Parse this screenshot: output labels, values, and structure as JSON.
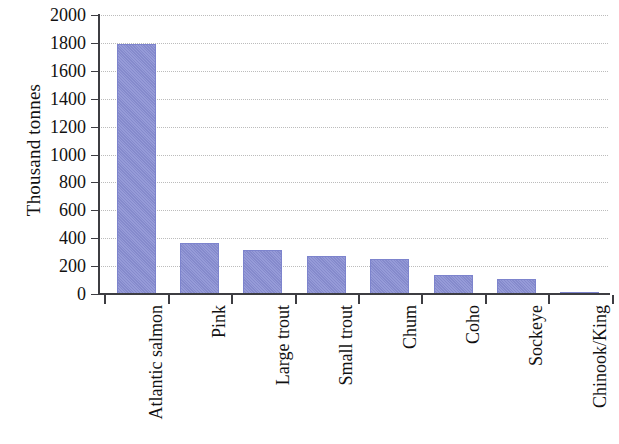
{
  "chart_data": {
    "type": "bar",
    "title": "",
    "subtitle": "",
    "xlabel": "",
    "ylabel": "Thousand tonnes",
    "categories": [
      "Atlantic salmon",
      "Pink",
      "Large trout",
      "Small trout",
      "Chum",
      "Coho",
      "Sockeye",
      "Chinook/King"
    ],
    "values": [
      1790,
      365,
      316,
      272,
      248,
      136,
      107,
      12
    ],
    "ylim": [
      0,
      2000
    ],
    "ytick_labels": [
      "2000",
      "1800",
      "1600",
      "1400",
      "1200",
      "1000",
      "800",
      "600",
      "400",
      "200",
      "0"
    ],
    "ytick_values": [
      2000,
      1800,
      1600,
      1400,
      1200,
      1000,
      800,
      600,
      400,
      200,
      0
    ],
    "grid": "horizontal-dotted",
    "legend": "none",
    "bar_color": "#8a90d4",
    "axis_color": "#3d3d42",
    "grid_color": "#bcbcbc",
    "text_color": "#111111"
  }
}
